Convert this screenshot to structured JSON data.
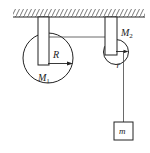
{
  "diagram": {
    "labels": {
      "large_pulley_mass": "M",
      "large_pulley_mass_sub": "1",
      "large_pulley_radius": "R",
      "small_pulley_mass": "M",
      "small_pulley_mass_sub": "2",
      "small_pulley_radius": "r",
      "hanging_mass": "m"
    },
    "colors": {
      "stroke": "#222222",
      "background": "#ffffff"
    }
  }
}
